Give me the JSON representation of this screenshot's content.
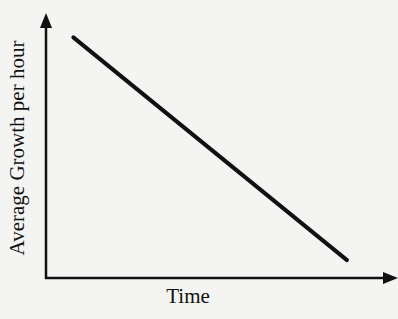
{
  "chart_data": {
    "type": "line",
    "title": "",
    "xlabel": "Time",
    "ylabel": "Average Growth per hour",
    "x_ticks": [],
    "y_ticks": [],
    "grid": false,
    "legend": null,
    "series": [
      {
        "name": "Average Growth per hour",
        "trend": "linear decreasing",
        "points": [
          {
            "x": 0.08,
            "y": 0.94
          },
          {
            "x": 0.88,
            "y": 0.07
          }
        ]
      }
    ],
    "xlim": [
      0,
      1
    ],
    "ylim": [
      0,
      1
    ],
    "colors": {
      "line": "#111111",
      "axes": "#111111",
      "background": "#f4f4f2"
    }
  }
}
